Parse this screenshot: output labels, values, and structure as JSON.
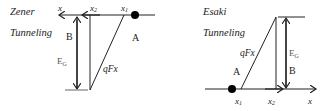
{
  "zener": {
    "title_line1": "Zener",
    "title_line2": "Tunneling",
    "axis_label": "x",
    "x1_label": "x",
    "x1_sub": "1",
    "x2_label": "x",
    "x2_sub": "2",
    "region_a": "A",
    "region_b": "B",
    "gap_label": "E",
    "gap_sub": "G",
    "field_label": "qFx"
  },
  "esaki": {
    "title_line1": "Esaki",
    "title_line2": "Tunneling",
    "axis_label": "x",
    "x1_label": "x",
    "x1_sub": "1",
    "x2_label": "x",
    "x2_sub": "2",
    "region_a": "A",
    "region_b": "B",
    "gap_label": "E",
    "gap_sub": "G",
    "field_label": "qFx"
  },
  "colors": {
    "line": "#222222",
    "dot": "#000000",
    "floor": "#999999"
  }
}
